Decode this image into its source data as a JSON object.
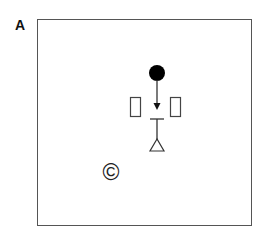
{
  "panel": {
    "label": "A"
  },
  "diagram": {
    "symbols": [
      {
        "name": "filled-circle",
        "cx": 157,
        "cy": 73,
        "r": 8,
        "color": "#000000"
      },
      {
        "name": "down-arrow",
        "x": 157,
        "y1": 81,
        "y2": 110
      },
      {
        "name": "left-rectangle",
        "x": 130,
        "y": 97,
        "w": 11,
        "h": 20
      },
      {
        "name": "right-rectangle",
        "x": 170,
        "y": 97,
        "w": 11,
        "h": 20
      },
      {
        "name": "t-bar",
        "x1": 150,
        "x2": 164,
        "y": 119,
        "stem_to": 140
      },
      {
        "name": "open-triangle",
        "apex": [
          157,
          139
        ],
        "base_y": 151,
        "base_x": [
          150,
          164
        ]
      }
    ],
    "copyright_symbol": "©",
    "stroke_color": "#333333",
    "frame_color": "#555555"
  }
}
